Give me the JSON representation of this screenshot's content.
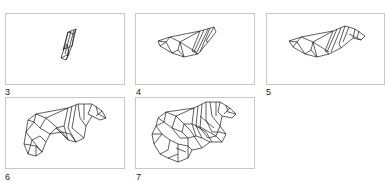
{
  "figure": {
    "panels": [
      {
        "id": "3",
        "label": "3"
      },
      {
        "id": "4",
        "label": "4"
      },
      {
        "id": "5",
        "label": "5"
      },
      {
        "id": "6",
        "label": "6"
      },
      {
        "id": "7",
        "label": "7"
      }
    ],
    "colors": {
      "frame_border": "#c8c8c8",
      "mesh_stroke": "#1a1a1a",
      "background": "#ffffff",
      "label_text": "#222222"
    }
  }
}
